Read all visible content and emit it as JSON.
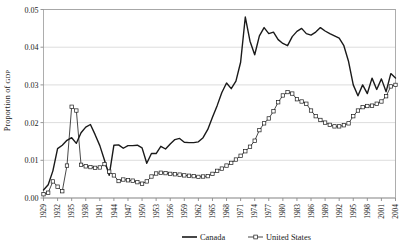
{
  "chart_data": {
    "type": "line",
    "title": "",
    "xlabel": "",
    "ylabel": "Proportion of GDP",
    "ylabel_parts": {
      "main": "Proportion of ",
      "smallcaps": "GDP"
    },
    "xlim": [
      1929,
      2004
    ],
    "ylim": [
      0.0,
      0.05
    ],
    "grid": true,
    "grid_axis": "y",
    "legend_position": "bottom-center",
    "ytick_labels": [
      "0.00",
      "0.01",
      "0.02",
      "0.03",
      "0.04",
      "0.05"
    ],
    "ytick_values": [
      0.0,
      0.01,
      0.02,
      0.03,
      0.04,
      0.05
    ],
    "xtick_labels": [
      "1929",
      "1932",
      "1935",
      "1938",
      "1941",
      "1944",
      "1947",
      "1950",
      "1953",
      "1956",
      "1959",
      "1962",
      "1965",
      "1968",
      "1971",
      "1974",
      "1977",
      "1980",
      "1983",
      "1986",
      "1989",
      "1992",
      "1995",
      "1998",
      "2001",
      "2004"
    ],
    "xtick_values": [
      1929,
      1932,
      1935,
      1938,
      1941,
      1944,
      1947,
      1950,
      1953,
      1956,
      1959,
      1962,
      1965,
      1968,
      1971,
      1974,
      1977,
      1980,
      1983,
      1986,
      1989,
      1992,
      1995,
      1998,
      2001,
      2004
    ],
    "x": [
      1929,
      1930,
      1931,
      1932,
      1933,
      1934,
      1935,
      1936,
      1937,
      1938,
      1939,
      1940,
      1941,
      1942,
      1943,
      1944,
      1945,
      1946,
      1947,
      1948,
      1949,
      1950,
      1951,
      1952,
      1953,
      1954,
      1955,
      1956,
      1957,
      1958,
      1959,
      1960,
      1961,
      1962,
      1963,
      1964,
      1965,
      1966,
      1967,
      1968,
      1969,
      1970,
      1971,
      1972,
      1973,
      1974,
      1975,
      1976,
      1977,
      1978,
      1979,
      1980,
      1981,
      1982,
      1983,
      1984,
      1985,
      1986,
      1987,
      1988,
      1989,
      1990,
      1991,
      1992,
      1993,
      1994,
      1995,
      1996,
      1997,
      1998,
      1999,
      2000,
      2001,
      2002,
      2003,
      2004
    ],
    "series": [
      {
        "name": "Canada",
        "color": "#1a1a1a",
        "marker": "none",
        "line_width": 1.4,
        "values": [
          0.0021,
          0.0035,
          0.0072,
          0.0131,
          0.014,
          0.0153,
          0.016,
          0.0145,
          0.0173,
          0.0188,
          0.0195,
          0.0168,
          0.0139,
          0.01,
          0.006,
          0.014,
          0.0141,
          0.0132,
          0.0139,
          0.0139,
          0.014,
          0.0133,
          0.0092,
          0.0118,
          0.0118,
          0.0137,
          0.013,
          0.0143,
          0.0155,
          0.0158,
          0.0148,
          0.0147,
          0.0147,
          0.0149,
          0.016,
          0.0182,
          0.0214,
          0.0245,
          0.028,
          0.0305,
          0.029,
          0.031,
          0.036,
          0.048,
          0.0416,
          0.038,
          0.043,
          0.0452,
          0.0436,
          0.044,
          0.042,
          0.041,
          0.0404,
          0.0428,
          0.0442,
          0.045,
          0.0436,
          0.0432,
          0.044,
          0.0452,
          0.0443,
          0.0436,
          0.043,
          0.0424,
          0.0404,
          0.0362,
          0.03,
          0.0271,
          0.03,
          0.0277,
          0.0318,
          0.0288,
          0.0316,
          0.0282,
          0.033,
          0.0318
        ]
      },
      {
        "name": "United States",
        "color": "#1a1a1a",
        "marker": "open-square",
        "line_width": 0.8,
        "values": [
          0.001,
          0.0014,
          0.0044,
          0.003,
          0.0018,
          0.0086,
          0.0242,
          0.0232,
          0.0088,
          0.0084,
          0.0082,
          0.008,
          0.0081,
          0.009,
          0.007,
          0.006,
          0.0045,
          0.0049,
          0.0047,
          0.0046,
          0.0042,
          0.0038,
          0.0044,
          0.0057,
          0.0065,
          0.0067,
          0.0066,
          0.0064,
          0.0063,
          0.0062,
          0.006,
          0.0059,
          0.0058,
          0.0056,
          0.0057,
          0.0058,
          0.0064,
          0.0072,
          0.0078,
          0.0086,
          0.0093,
          0.0102,
          0.0112,
          0.0124,
          0.0136,
          0.0152,
          0.018,
          0.0198,
          0.0211,
          0.023,
          0.0254,
          0.0272,
          0.0281,
          0.0277,
          0.0262,
          0.0256,
          0.025,
          0.0232,
          0.0217,
          0.0207,
          0.02,
          0.0194,
          0.019,
          0.019,
          0.0193,
          0.0198,
          0.0217,
          0.0232,
          0.0241,
          0.0244,
          0.0245,
          0.025,
          0.0256,
          0.027,
          0.0296,
          0.03
        ]
      }
    ]
  },
  "legend": {
    "entries": [
      {
        "label": "Canada",
        "style": "solid-line"
      },
      {
        "label": "United States",
        "style": "line-with-open-square-marker"
      }
    ]
  }
}
